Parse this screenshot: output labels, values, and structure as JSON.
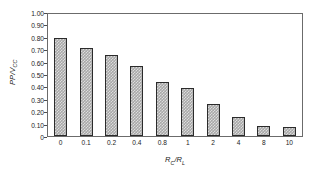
{
  "chart_data": {
    "type": "bar",
    "title": "",
    "subtitle": "",
    "xlabel": "R_C / R_L",
    "ylabel": "PP / V_CC",
    "categories": [
      "0",
      "0.1",
      "0.2",
      "0.4",
      "0.8",
      "1",
      "2",
      "4",
      "8",
      "10"
    ],
    "values": [
      0.8,
      0.72,
      0.66,
      0.57,
      0.44,
      0.395,
      0.26,
      0.155,
      0.085,
      0.07
    ],
    "ylim": [
      0,
      1.0
    ],
    "ytick_values": [
      0,
      0.1,
      0.2,
      0.3,
      0.4,
      0.5,
      0.6,
      0.7,
      0.8,
      0.9,
      1.0
    ],
    "ytick_labels": [
      "0",
      "0.10",
      "0.20",
      "0.30",
      "0.40",
      "0.50",
      "0.60",
      "0.70",
      "0.80",
      "0.90",
      "1.00"
    ],
    "grid": false,
    "legend": null,
    "bar_color": "#a8a8a8",
    "bar_edge_color": "#2b2b2b",
    "frame_color": "#6b6b6b",
    "background_color": "#ffffff",
    "annotations": []
  },
  "axis_titles": {
    "y": {
      "main": "PP",
      "separator": "/",
      "second_main": "V",
      "second_sub": "CC"
    },
    "x": {
      "main": "R",
      "sub": "C",
      "separator": "/",
      "second_main": "R",
      "second_sub": "L"
    }
  }
}
